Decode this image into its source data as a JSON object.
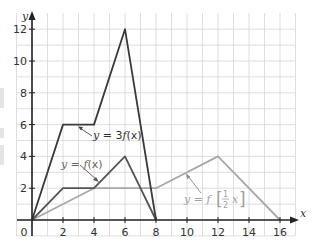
{
  "chart_data": {
    "type": "line",
    "title": "",
    "xlabel": "x",
    "ylabel": "y",
    "xlim": [
      0,
      16
    ],
    "ylim": [
      0,
      12
    ],
    "grid": true,
    "grid_step": 1,
    "x_ticks": [
      "0",
      "2",
      "4",
      "6",
      "8",
      "10",
      "12",
      "14",
      "16"
    ],
    "y_ticks": [
      "2",
      "4",
      "6",
      "8",
      "10",
      "12"
    ],
    "origin_label": "0",
    "series": [
      {
        "name": "y = 3f(x)",
        "color": "#3a3a3a",
        "points": [
          [
            0,
            0
          ],
          [
            2,
            6
          ],
          [
            4,
            6
          ],
          [
            6,
            12
          ],
          [
            8,
            0
          ]
        ]
      },
      {
        "name": "y = f(x)",
        "color": "#555555",
        "points": [
          [
            0,
            0
          ],
          [
            2,
            2
          ],
          [
            4,
            2
          ],
          [
            6,
            4
          ],
          [
            8,
            0
          ]
        ]
      },
      {
        "name": "y = f(1/2 x)",
        "color": "#a8a8a8",
        "points": [
          [
            0,
            0
          ],
          [
            4,
            2
          ],
          [
            8,
            2
          ],
          [
            12,
            4
          ],
          [
            16,
            0
          ]
        ]
      }
    ],
    "annotations": [
      {
        "text": "y = 3f(x)",
        "points_to": [
          3,
          6
        ]
      },
      {
        "text": "y = f(x)",
        "points_to": [
          5,
          3
        ]
      },
      {
        "text": "y = f(1/2 x)",
        "points_to": [
          10,
          3
        ]
      }
    ]
  },
  "labels": {
    "three_f": {
      "y": "y",
      "eq": " = 3",
      "f": "f",
      "arg": "(x)"
    },
    "f": {
      "y": "y",
      "eq": " = ",
      "f": "f",
      "arg": "(x)"
    },
    "half": {
      "y": "y",
      "eq": " = ",
      "f": "f",
      "num": "1",
      "den": "2",
      "x": "x"
    }
  }
}
